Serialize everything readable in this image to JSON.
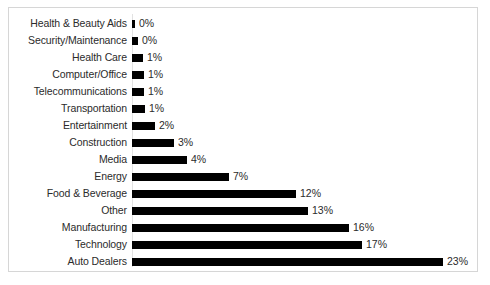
{
  "chart_data": {
    "type": "bar",
    "orientation": "horizontal",
    "title": "",
    "xlabel": "",
    "ylabel": "",
    "xlim": [
      0,
      25
    ],
    "grid": false,
    "legend": false,
    "bar_color": "#000000",
    "border_color": "#d6d6d6",
    "axis_color": "#e2e2e2",
    "text_color": "#2b2b2b",
    "data_labels_suffix": "%",
    "categories": [
      "Health & Beauty Aids",
      "Security/Maintenance",
      "Health Care",
      "Computer/Office",
      "Telecommunications",
      "Transportation",
      "Entertainment",
      "Construction",
      "Media",
      "Energy",
      "Food & Beverage",
      "Other",
      "Manufacturing",
      "Technology",
      "Auto Dealers"
    ],
    "values": [
      0,
      0,
      1,
      1,
      1,
      1,
      2,
      3,
      4,
      7,
      12,
      13,
      16,
      17,
      23
    ],
    "labels": [
      "0%",
      "0%",
      "1%",
      "1%",
      "1%",
      "1%",
      "2%",
      "3%",
      "4%",
      "7%",
      "12%",
      "13%",
      "16%",
      "17%",
      "23%"
    ],
    "bar_pixel_widths": [
      3,
      6,
      11,
      12,
      12,
      13,
      23,
      42,
      55,
      97,
      164,
      176,
      217,
      230,
      311
    ]
  }
}
